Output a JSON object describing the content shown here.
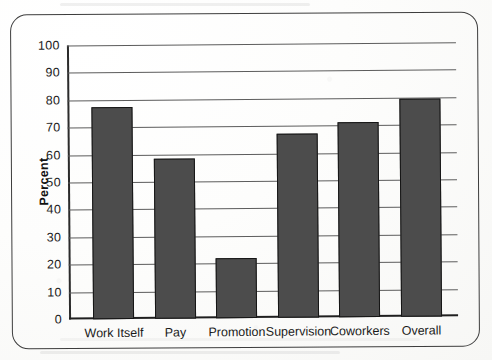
{
  "figure": {
    "frame_style": "rounded-rectangle-border",
    "border_color": "#3d3d3d",
    "background_color": "#ffffff"
  },
  "axis": {
    "y_label": "Percent",
    "y_ticks": [
      "100",
      "90",
      "80",
      "70",
      "60",
      "50",
      "40",
      "30",
      "20",
      "10",
      "0"
    ]
  },
  "bar_style": {
    "fill_color": "#4c4c4c",
    "outline_color": "#151515"
  },
  "chart_data": {
    "type": "bar",
    "title": "",
    "xlabel": "",
    "ylabel": "Percent",
    "ylim": [
      0,
      100
    ],
    "ytick_step": 10,
    "grid": true,
    "grid_orientation": "horizontal",
    "legend": false,
    "categories": [
      "Work Itself",
      "Pay",
      "Promotion",
      "Supervision",
      "Coworkers",
      "Overall"
    ],
    "values": [
      77.5,
      58.5,
      22,
      67,
      71,
      79.5
    ]
  }
}
